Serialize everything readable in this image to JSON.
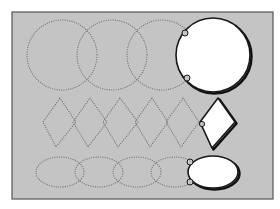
{
  "colors": {
    "page_bg": "#ffffff",
    "panel_bg": "#c4c4c4",
    "panel_border": "#555555",
    "dotted_stroke": "#6a6a6a",
    "cutout_fill": "#ffffff",
    "cutout_stroke": "#1a1a1a"
  },
  "frame": {
    "x": 12,
    "y": 12,
    "width": 261,
    "height": 187
  },
  "rows": {
    "circles": {
      "dotted": [
        {
          "cx": 62,
          "cy": 55,
          "r": 35
        },
        {
          "cx": 112,
          "cy": 55,
          "r": 35
        },
        {
          "cx": 162,
          "cy": 55,
          "r": 35
        }
      ],
      "solid": {
        "cx": 213,
        "cy": 55,
        "r": 37,
        "notches": [
          {
            "x": 185,
            "y": 33
          },
          {
            "x": 187,
            "y": 78
          }
        ]
      }
    },
    "diamonds": {
      "dotted": [
        {
          "top": [
            60,
            98
          ],
          "right": [
            76,
            122
          ],
          "bottom": [
            56,
            147
          ],
          "left": [
            43,
            122
          ]
        },
        {
          "top": [
            90,
            98
          ],
          "right": [
            107,
            122
          ],
          "bottom": [
            88,
            147
          ],
          "left": [
            73,
            122
          ]
        },
        {
          "top": [
            120,
            98
          ],
          "right": [
            138,
            122
          ],
          "bottom": [
            118,
            147
          ],
          "left": [
            103,
            122
          ]
        },
        {
          "top": [
            152,
            98
          ],
          "right": [
            168,
            122
          ],
          "bottom": [
            150,
            147
          ],
          "left": [
            135,
            122
          ]
        },
        {
          "top": [
            183,
            98
          ],
          "right": [
            199,
            122
          ],
          "bottom": [
            181,
            147
          ],
          "left": [
            166,
            122
          ]
        }
      ],
      "solid": {
        "top": [
          218,
          98
        ],
        "right": [
          235,
          122
        ],
        "bottom": [
          212,
          148
        ],
        "left": [
          200,
          122
        ],
        "notch": {
          "x": 202,
          "y": 124
        }
      }
    },
    "ellipses": {
      "dotted": [
        {
          "cx": 60,
          "cy": 172,
          "rx": 24,
          "ry": 15
        },
        {
          "cx": 99,
          "cy": 172,
          "rx": 24,
          "ry": 15
        },
        {
          "cx": 137,
          "cy": 172,
          "rx": 24,
          "ry": 15
        },
        {
          "cx": 175,
          "cy": 172,
          "rx": 24,
          "ry": 15
        }
      ],
      "solid": {
        "cx": 213,
        "cy": 172,
        "rx": 25,
        "ry": 16,
        "notches": [
          {
            "x": 190,
            "y": 162
          },
          {
            "x": 190,
            "y": 182
          }
        ]
      }
    }
  }
}
